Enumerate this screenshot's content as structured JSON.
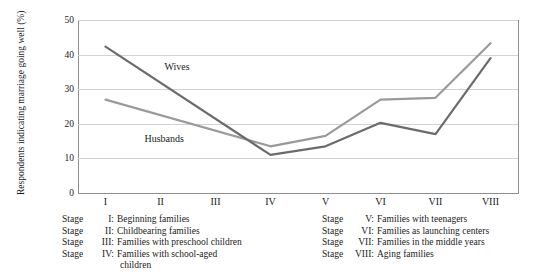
{
  "chart_data": {
    "type": "line",
    "title": "",
    "xlabel": "",
    "ylabel": "Respondents indicating marriage going well (%)",
    "categories": [
      "I",
      "II",
      "III",
      "IV",
      "V",
      "VI",
      "VII",
      "VIII"
    ],
    "ylim": [
      0,
      50
    ],
    "yticks": [
      "0",
      "10",
      "20",
      "30",
      "40",
      "50"
    ],
    "ytick_values": [
      0,
      10,
      20,
      30,
      40,
      50
    ],
    "grid": "horizontal",
    "legend_position": "inline-labels",
    "series": [
      {
        "name": "Wives",
        "color": "#6b6b6b",
        "values": [
          42.3,
          null,
          null,
          11.0,
          13.5,
          20.3,
          17.0,
          39.0
        ]
      },
      {
        "name": "Husbands",
        "color": "#9a9a9a",
        "values": [
          27.0,
          null,
          null,
          13.5,
          16.5,
          27.0,
          27.5,
          43.3
        ]
      }
    ],
    "annotations": [
      {
        "text": "Wives",
        "x_category": "II",
        "value": 36
      },
      {
        "text": "Husbands",
        "x_category": "II",
        "value": 15.5
      }
    ]
  },
  "axes": {
    "x_tick_labels": [
      "I",
      "II",
      "III",
      "IV",
      "V",
      "VI",
      "VII",
      "VIII"
    ],
    "y_tick_labels": [
      "50",
      "40",
      "30",
      "20",
      "10",
      "0"
    ]
  },
  "caption": {
    "left_column": [
      {
        "stage_word": "Stage",
        "numeral": "I:",
        "text": "Beginning families"
      },
      {
        "stage_word": "Stage",
        "numeral": "II:",
        "text": "Childbearing families"
      },
      {
        "stage_word": "Stage",
        "numeral": "III:",
        "text": "Families with preschool children"
      },
      {
        "stage_word": "Stage",
        "numeral": "IV:",
        "text": "Families with school-aged"
      }
    ],
    "left_continuation": "children",
    "right_column": [
      {
        "stage_word": "Stage",
        "numeral": "V:",
        "text": "Families with teenagers"
      },
      {
        "stage_word": "Stage",
        "numeral": "VI:",
        "text": "Families as launching centers"
      },
      {
        "stage_word": "Stage",
        "numeral": "VII:",
        "text": "Families in the middle years"
      },
      {
        "stage_word": "Stage",
        "numeral": "VIII:",
        "text": "Aging families"
      }
    ]
  },
  "colors": {
    "wives_line": "#6b6b6b",
    "husbands_line": "#9a9a9a",
    "gridline": "#d2d2d2",
    "axis": "#8f8f8f",
    "text": "#1a1a1a"
  }
}
